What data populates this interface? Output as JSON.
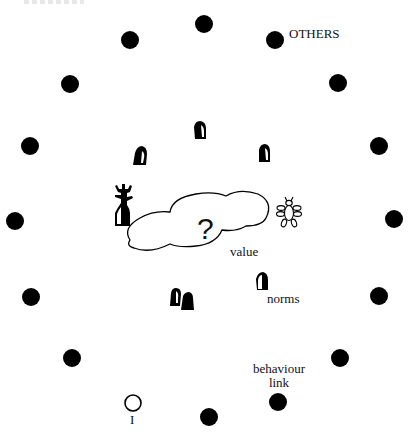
{
  "diagram": {
    "labels": {
      "others": "OTHERS",
      "value": "value",
      "norms": "norms",
      "behaviour_link_line1": "behaviour",
      "behaviour_link_line2": "link",
      "self": "I",
      "cloud_symbol": "?"
    },
    "colors": {
      "background": "#ffffff",
      "ink": "#000000"
    },
    "others_dots": [
      {
        "x": 204,
        "y": 24
      },
      {
        "x": 275,
        "y": 40
      },
      {
        "x": 338,
        "y": 83
      },
      {
        "x": 379,
        "y": 146
      },
      {
        "x": 394,
        "y": 219
      },
      {
        "x": 379,
        "y": 296
      },
      {
        "x": 340,
        "y": 358
      },
      {
        "x": 278,
        "y": 402
      },
      {
        "x": 209,
        "y": 417
      },
      {
        "x": 72,
        "y": 358
      },
      {
        "x": 31,
        "y": 297
      },
      {
        "x": 15,
        "y": 221
      },
      {
        "x": 30,
        "y": 146
      },
      {
        "x": 70,
        "y": 84
      },
      {
        "x": 130,
        "y": 40
      }
    ],
    "self_node": {
      "x": 133,
      "y": 403,
      "filled": false
    },
    "norm_stones": [
      {
        "x": 200,
        "y": 131
      },
      {
        "x": 140,
        "y": 157
      },
      {
        "x": 264,
        "y": 154
      },
      {
        "x": 176,
        "y": 298
      },
      {
        "x": 187,
        "y": 301
      },
      {
        "x": 262,
        "y": 283
      }
    ],
    "icons": {
      "left_figure": "human-figure-icon",
      "right_figure": "insect-figure-icon",
      "cloud": "cloud-icon"
    }
  }
}
